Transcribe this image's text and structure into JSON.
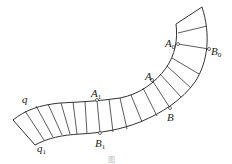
{
  "diagram": {
    "curves": [
      {
        "name": "q",
        "label": "q"
      },
      {
        "name": "q1",
        "label": "q",
        "sub": "1"
      }
    ],
    "points": [
      {
        "name": "A0",
        "label": "A",
        "sub": "0"
      },
      {
        "name": "B0",
        "label": "B",
        "sub": "0"
      },
      {
        "name": "A",
        "label": "A",
        "sub": ""
      },
      {
        "name": "B",
        "label": "B",
        "sub": ""
      },
      {
        "name": "A1",
        "label": "A",
        "sub": "1"
      },
      {
        "name": "B1",
        "label": "B",
        "sub": "1"
      }
    ],
    "caption": "图"
  }
}
